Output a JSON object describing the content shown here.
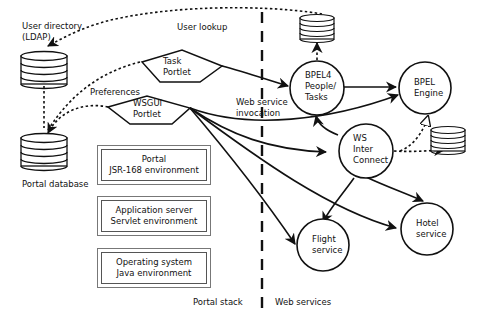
{
  "diagram": {
    "colors": {
      "line": "#111111",
      "background": "#ffffff",
      "box_border": "#555555"
    },
    "divider": {
      "style": "dashed",
      "left_label": "Portal stack",
      "right_label": "Web services"
    },
    "databases": {
      "ldap": {
        "label_line1": "User directory",
        "label_line2": "(LDAP)"
      },
      "portal_db": {
        "label": "Portal database"
      },
      "tasks_db": {
        "label": ""
      },
      "engine_db": {
        "label": ""
      }
    },
    "portlets": {
      "task": {
        "line1": "Task",
        "line2": "Portlet"
      },
      "wsgui": {
        "line1": "WSGUI",
        "line2": "Portlet"
      }
    },
    "services": {
      "bpel4people": {
        "line1": "BPEL4",
        "line2": "People/",
        "line3": "Tasks"
      },
      "bpel_engine": {
        "line1": "BPEL",
        "line2": "Engine"
      },
      "ws_interconnect": {
        "line1": "WS",
        "line2": "Inter",
        "line3": "Connect"
      },
      "flight": {
        "line1": "Flight",
        "line2": "service"
      },
      "hotel": {
        "line1": "Hotel",
        "line2": "service"
      }
    },
    "stack_boxes": [
      {
        "line1": "Portal",
        "line2": "JSR-168 environment"
      },
      {
        "line1": "Application server",
        "line2": "Servlet environment"
      },
      {
        "line1": "Operating system",
        "line2": "Java environment"
      }
    ],
    "edge_labels": {
      "user_lookup": "User lookup",
      "preferences": "Preferences",
      "ws_invocation_line1": "Web service",
      "ws_invocation_line2": "invocation"
    }
  }
}
